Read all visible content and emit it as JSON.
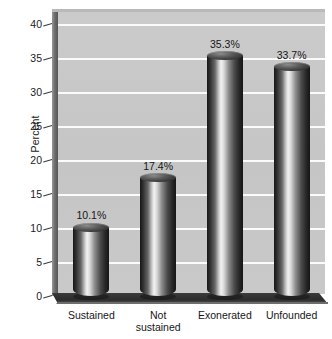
{
  "chart_data": {
    "type": "bar",
    "title": "",
    "subtitle": "",
    "xlabel": "",
    "ylabel": "Percent",
    "categories": [
      "Sustained",
      "Not\nsustained",
      "Exonerated",
      "Unfounded"
    ],
    "values": [
      10.1,
      17.4,
      35.3,
      33.7
    ],
    "data_labels": [
      "10.1%",
      "17.4%",
      "35.3%",
      "33.7%"
    ],
    "ylim": [
      0,
      40
    ],
    "ytick_values": [
      0,
      5,
      10,
      15,
      20,
      25,
      30,
      35,
      40
    ],
    "ytick_labels": [
      "0",
      "5",
      "10",
      "15",
      "20",
      "25",
      "30",
      "35",
      "40"
    ],
    "grid": true,
    "gridline_color": "#fbfbfb",
    "legend": null,
    "legend_position": "none",
    "style": "3d-cylinder",
    "plot_background": "#c8c8c8",
    "bar_color_dark": "#171717",
    "bar_color_highlight": "#f3f3f3",
    "text_color": "#161616"
  },
  "axis": {
    "y_title": "Percent"
  }
}
